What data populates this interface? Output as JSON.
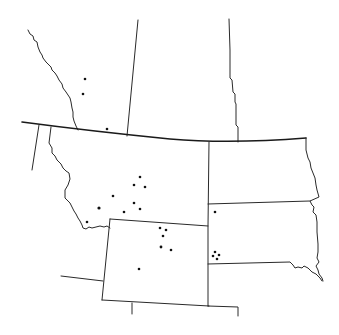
{
  "map": {
    "title": "",
    "description": "Outline map of the northern Great Plains / Rocky Mountain region (Montana, Wyoming, North Dakota, South Dakota with adjacent Canadian provinces) showing point occurrence locations",
    "colors": {
      "background": "#ffffff",
      "border": "#2a2a2a",
      "point": "#111111"
    },
    "regions": [
      {
        "name": "British Columbia / Alberta boundary",
        "type": "provincial-border"
      },
      {
        "name": "Alberta / Saskatchewan boundary",
        "type": "provincial-border"
      },
      {
        "name": "Saskatchewan / Manitoba boundary",
        "type": "provincial-border"
      },
      {
        "name": "Canada / United States boundary (49th parallel)",
        "type": "international-border"
      },
      {
        "name": "Montana",
        "type": "state"
      },
      {
        "name": "Idaho",
        "type": "state"
      },
      {
        "name": "Wyoming",
        "type": "state"
      },
      {
        "name": "North Dakota",
        "type": "state"
      },
      {
        "name": "South Dakota",
        "type": "state"
      },
      {
        "name": "Nebraska",
        "type": "state"
      }
    ],
    "points": [
      {
        "id": 1,
        "region": "Alberta",
        "x": 85,
        "y": 79
      },
      {
        "id": 2,
        "region": "Alberta",
        "x": 83,
        "y": 94
      },
      {
        "id": 3,
        "region": "Alberta",
        "x": 107,
        "y": 129
      },
      {
        "id": 4,
        "region": "Montana",
        "x": 140,
        "y": 177
      },
      {
        "id": 5,
        "region": "Montana",
        "x": 134,
        "y": 185
      },
      {
        "id": 6,
        "region": "Montana",
        "x": 145,
        "y": 187
      },
      {
        "id": 7,
        "region": "Montana",
        "x": 113,
        "y": 196
      },
      {
        "id": 8,
        "region": "Montana",
        "x": 99,
        "y": 208
      },
      {
        "id": 9,
        "region": "Montana",
        "x": 134,
        "y": 203
      },
      {
        "id": 10,
        "region": "Montana",
        "x": 124,
        "y": 212
      },
      {
        "id": 11,
        "region": "Montana",
        "x": 140,
        "y": 209
      },
      {
        "id": 12,
        "region": "Montana",
        "x": 87,
        "y": 222
      },
      {
        "id": 13,
        "region": "Wyoming",
        "x": 160,
        "y": 228
      },
      {
        "id": 14,
        "region": "Wyoming",
        "x": 166,
        "y": 230
      },
      {
        "id": 15,
        "region": "Wyoming",
        "x": 163,
        "y": 236
      },
      {
        "id": 16,
        "region": "Wyoming",
        "x": 161,
        "y": 247
      },
      {
        "id": 17,
        "region": "Wyoming",
        "x": 171,
        "y": 250
      },
      {
        "id": 18,
        "region": "Wyoming",
        "x": 139,
        "y": 269
      },
      {
        "id": 19,
        "region": "South Dakota",
        "x": 215,
        "y": 212
      },
      {
        "id": 20,
        "region": "South Dakota",
        "x": 215,
        "y": 252
      },
      {
        "id": 21,
        "region": "South Dakota",
        "x": 213,
        "y": 256
      },
      {
        "id": 22,
        "region": "South Dakota",
        "x": 219,
        "y": 255
      },
      {
        "id": 23,
        "region": "South Dakota",
        "x": 217,
        "y": 259
      }
    ]
  }
}
